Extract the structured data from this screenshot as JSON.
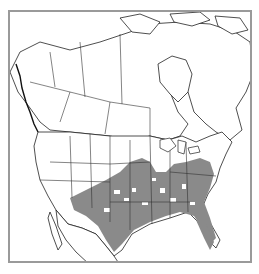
{
  "map": {
    "title": "",
    "region": "North America",
    "description": "Distribution range map of southern/eastern United States and northern Mexico",
    "colors": {
      "range_fill": "#8a8a8a",
      "land_fill": "#ffffff",
      "borders": "#333333",
      "frame": "#9a9a9a"
    },
    "legend": []
  }
}
